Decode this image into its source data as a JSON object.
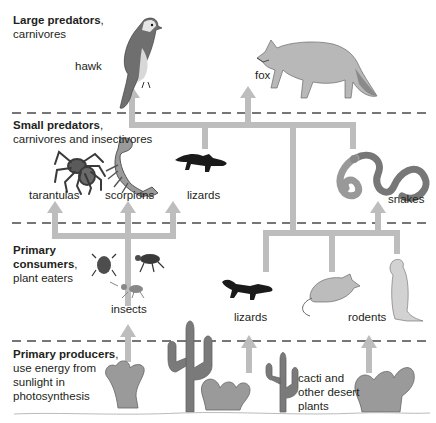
{
  "levels": [
    {
      "id": "large-predators",
      "title": "Large predators",
      "suffix": ",",
      "desc": [
        "carnivores"
      ]
    },
    {
      "id": "small-predators",
      "title": "Small predators",
      "suffix": ",",
      "desc": [
        "carnivores and insectivores"
      ]
    },
    {
      "id": "primary-consumers",
      "title_lines": [
        "Primary",
        "consumers"
      ],
      "suffix": ",",
      "desc": [
        "plant eaters"
      ]
    },
    {
      "id": "primary-producers",
      "title": "Primary producers",
      "suffix": ",",
      "desc": [
        "use energy from",
        "sunlight in",
        "photosynthesis"
      ]
    }
  ],
  "organisms": {
    "hawk": "hawk",
    "fox": "fox",
    "tarantulas": "tarantulas",
    "scorpions": "scorpions",
    "lizards_small": "lizards",
    "snakes": "snakes",
    "insects": "insects",
    "lizards_consumer": "lizards",
    "rodents": "rodents",
    "plants": [
      "cacti and",
      "other desert",
      "plants"
    ]
  },
  "colors": {
    "arrow": "#bdbdbd",
    "dash": "#4a4a4a",
    "text": "#231f20",
    "animal": "#8c8c8c",
    "animal_dark": "#1a1a1a",
    "plant": "#9a9a9a"
  }
}
